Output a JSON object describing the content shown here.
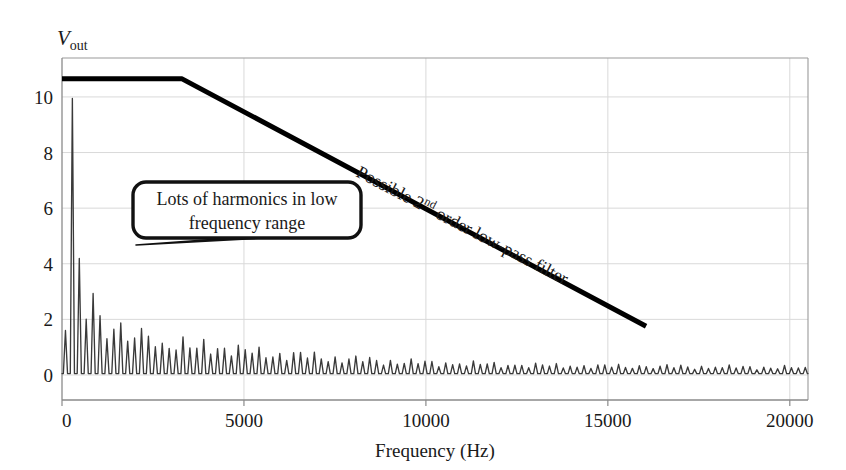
{
  "chart_data": {
    "type": "line",
    "title": "",
    "xlabel": "Frequency (Hz)",
    "ylabel": "V out",
    "ylabel_var": "V",
    "ylabel_sub": "out",
    "xlim": [
      0,
      20500
    ],
    "ylim": [
      -0.9,
      11.4
    ],
    "xticks": [
      0,
      5000,
      10000,
      15000,
      20000
    ],
    "xtick_labels": [
      "0",
      "5000",
      "10000",
      "15000",
      "20000"
    ],
    "yticks": [
      0,
      2,
      4,
      6,
      8,
      10
    ],
    "ytick_labels": [
      "0",
      "2",
      "4",
      "6",
      "8",
      "10"
    ],
    "grid": true,
    "legend": "none",
    "series": [
      {
        "name": "spectrum",
        "type": "line",
        "color": "#3a3a3a",
        "description": "Harmonic spectrum of a periodic waveform: tall spikes at low frequency decaying toward a low-amplitude ripple floor",
        "fundamental_hz": 190,
        "harmonic_peaks": [
          {
            "freq": 95,
            "amp": 1.6
          },
          {
            "freq": 190,
            "amp": 8.75
          },
          {
            "freq": 380,
            "amp": 7.2
          },
          {
            "freq": 570,
            "amp": 2.1
          },
          {
            "freq": 760,
            "amp": 1.2
          },
          {
            "freq": 950,
            "amp": 4.35
          },
          {
            "freq": 1140,
            "amp": 1.5
          },
          {
            "freq": 1330,
            "amp": 0.9
          },
          {
            "freq": 1520,
            "amp": 3.1
          },
          {
            "freq": 1710,
            "amp": 1.1
          },
          {
            "freq": 1900,
            "amp": 0.8
          },
          {
            "freq": 2090,
            "amp": 2.05
          },
          {
            "freq": 2280,
            "amp": 0.9
          },
          {
            "freq": 2470,
            "amp": 1.5
          },
          {
            "freq": 2660,
            "amp": 1.35
          },
          {
            "freq": 2850,
            "amp": 0.85
          },
          {
            "freq": 3040,
            "amp": 1.25
          },
          {
            "freq": 3230,
            "amp": 1.0
          },
          {
            "freq": 3420,
            "amp": 1.15
          },
          {
            "freq": 3610,
            "amp": 0.8
          },
          {
            "freq": 3800,
            "amp": 1.05
          },
          {
            "freq": 4180,
            "amp": 1.0
          },
          {
            "freq": 4560,
            "amp": 0.95
          },
          {
            "freq": 4940,
            "amp": 0.85
          },
          {
            "freq": 5320,
            "amp": 0.8
          },
          {
            "freq": 5700,
            "amp": 0.75
          },
          {
            "freq": 6460,
            "amp": 0.7
          },
          {
            "freq": 7220,
            "amp": 0.62
          },
          {
            "freq": 7980,
            "amp": 0.55
          },
          {
            "freq": 8740,
            "amp": 0.5
          },
          {
            "freq": 9500,
            "amp": 0.45
          },
          {
            "freq": 11000,
            "amp": 0.4
          },
          {
            "freq": 12500,
            "amp": 0.35
          },
          {
            "freq": 14000,
            "amp": 0.32
          },
          {
            "freq": 16000,
            "amp": 0.3
          },
          {
            "freq": 18000,
            "amp": 0.28
          },
          {
            "freq": 20000,
            "amp": 0.26
          }
        ],
        "noise_floor": 0.05
      },
      {
        "name": "lowpass-filter-response",
        "type": "line",
        "color": "#000000",
        "linewidth": 5,
        "description": "Idealized 2nd order low-pass filter magnitude response: flat passband then linear roll-off",
        "points": [
          {
            "freq": 0,
            "amp": 10.65
          },
          {
            "freq": 3300,
            "amp": 10.65
          },
          {
            "freq": 16050,
            "amp": 1.75
          }
        ]
      }
    ],
    "annotations": [
      {
        "name": "filter-label",
        "text_parts": [
          "Possible 2",
          "nd",
          " order low-pass filter"
        ],
        "text": "Possible 2nd order low-pass filter",
        "rotation_deg": 27.5,
        "anchor_freq": 7000,
        "anchor_amp": 7.0
      },
      {
        "name": "harmonics-callout",
        "line1": "Lots of harmonics in low",
        "line2": "frequency range",
        "text": "Lots of harmonics in low frequency range",
        "box_freq_range": [
          7700,
          24500
        ],
        "box_amp_range": [
          4.6,
          6.9
        ],
        "pointer_target_freq": 1200,
        "pointer_target_amp": 3.85
      }
    ],
    "colors": {
      "background": "#ffffff",
      "axis": "#8a8a8a",
      "grid": "#d9d9d9",
      "spectrum": "#3a3a3a",
      "filter": "#000000",
      "text": "#1a1a1a"
    }
  },
  "axes": {
    "x_title": "Frequency (Hz)",
    "y_title_var": "V",
    "y_title_sub": "out"
  }
}
